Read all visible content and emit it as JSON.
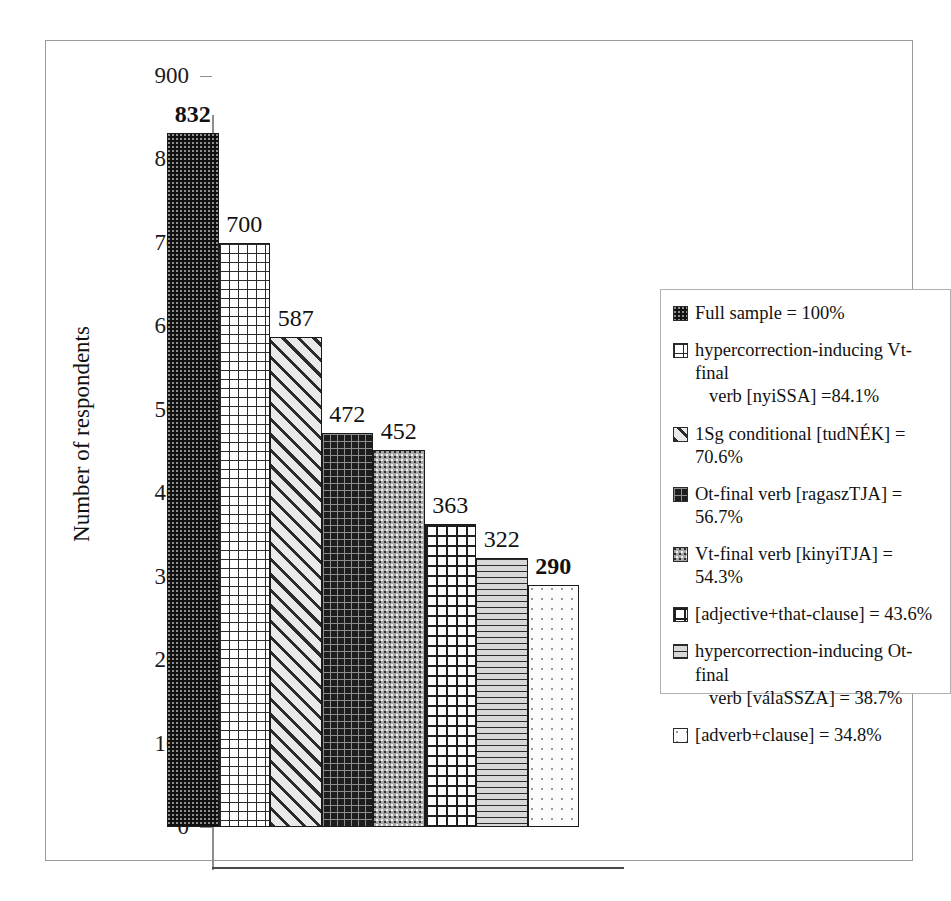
{
  "chart_data": {
    "type": "bar",
    "title": "",
    "subtitle": "",
    "xlabel": "",
    "ylabel": "Number of respondents",
    "ylim": [
      0,
      900
    ],
    "ytick_step": 100,
    "yticks": [
      "900",
      "800",
      "700",
      "600",
      "500",
      "400",
      "300",
      "200",
      "100",
      "0"
    ],
    "grid": false,
    "legend_position": "right",
    "categories": [
      "Full sample",
      "hypercorrection-inducing Vt-final verb [nyiSSA]",
      "1Sg conditional [tudNÉK]",
      "Ot-final verb [ragaszTJA]",
      "Vt-final verb [kinyiTJA]",
      "[adjective+that-clause]",
      "hypercorrection-inducing Ot-final verb [válaSSZA]",
      "[adverb+clause]"
    ],
    "values": [
      832,
      700,
      587,
      472,
      452,
      363,
      322,
      290
    ],
    "value_labels": [
      "832",
      "700",
      "587",
      "472",
      "452",
      "363",
      "322",
      "290"
    ],
    "value_label_bold": [
      true,
      false,
      false,
      false,
      false,
      false,
      false,
      true
    ],
    "percentages": [
      "100%",
      "84.1%",
      "70.6%",
      "56.7%",
      "54.3%",
      "43.6%",
      "38.7%",
      "34.8%"
    ],
    "fill_patterns": [
      "pat-dots-dark",
      "pat-grid-fine",
      "pat-diag",
      "pat-grid-dark",
      "pat-stipple-gray",
      "pat-checker",
      "pat-hlines",
      "pat-dots-light"
    ]
  },
  "axis": {
    "y_title": "Number of respondents",
    "ticks": [
      {
        "label": "900",
        "value": 900
      },
      {
        "label": "800",
        "value": 800
      },
      {
        "label": "700",
        "value": 700
      },
      {
        "label": "600",
        "value": 600
      },
      {
        "label": "500",
        "value": 500
      },
      {
        "label": "400",
        "value": 400
      },
      {
        "label": "300",
        "value": 300
      },
      {
        "label": "200",
        "value": 200
      },
      {
        "label": "100",
        "value": 100
      },
      {
        "label": "0",
        "value": 0
      }
    ]
  },
  "bars": [
    {
      "label": "832",
      "value": 832,
      "pattern": "pat-dots-dark",
      "bold": true
    },
    {
      "label": "700",
      "value": 700,
      "pattern": "pat-grid-fine",
      "bold": false
    },
    {
      "label": "587",
      "value": 587,
      "pattern": "pat-diag",
      "bold": false
    },
    {
      "label": "472",
      "value": 472,
      "pattern": "pat-grid-dark",
      "bold": false
    },
    {
      "label": "452",
      "value": 452,
      "pattern": "pat-stipple-gray",
      "bold": false
    },
    {
      "label": "363",
      "value": 363,
      "pattern": "pat-checker",
      "bold": false
    },
    {
      "label": "322",
      "value": 322,
      "pattern": "pat-hlines",
      "bold": false
    },
    {
      "label": "290",
      "value": 290,
      "pattern": "pat-dots-light",
      "bold": true
    }
  ],
  "legend": {
    "items": [
      {
        "swatch": "pat-dots-dark",
        "line1": "Full sample = 100%",
        "line2": ""
      },
      {
        "swatch": "pat-grid-fine",
        "line1": "hypercorrection-inducing Vt-final",
        "line2": "verb [nyiSSA] =84.1%"
      },
      {
        "swatch": "pat-diag",
        "line1": "1Sg conditional [tudNÉK] = 70.6%",
        "line2": ""
      },
      {
        "swatch": "pat-grid-dark",
        "line1": "Ot-final verb [ragaszTJA] = 56.7%",
        "line2": ""
      },
      {
        "swatch": "pat-stipple-gray",
        "line1": "Vt-final verb [kinyiTJA] = 54.3%",
        "line2": ""
      },
      {
        "swatch": "pat-checker",
        "line1": "[adjective+that-clause] = 43.6%",
        "line2": ""
      },
      {
        "swatch": "pat-hlines",
        "line1": "hypercorrection-inducing Ot-final",
        "line2": "verb [válaSSZA] = 38.7%"
      },
      {
        "swatch": "pat-dots-light",
        "line1": "[adverb+clause] = 34.8%",
        "line2": ""
      }
    ]
  },
  "colors": {
    "frame": "#9a9a9a",
    "axis": "#8e8e8e",
    "baseline": "#4a4a4a",
    "bar_outline": "#1a1a1a",
    "text": "#111111",
    "legend_border": "#b0b0b0"
  }
}
